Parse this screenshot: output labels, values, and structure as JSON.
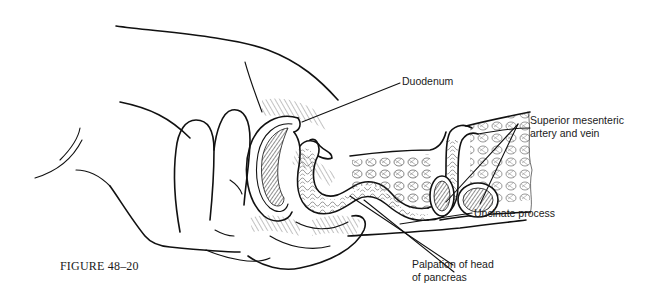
{
  "figure": {
    "caption": "FIGURE 48–20",
    "labels": {
      "duodenum": "Duodenum",
      "sma_line1": "Superior mesenteric",
      "sma_line2": "artery and vein",
      "uncinate": "Uncinate process",
      "palpation_line1": "Palpation of head",
      "palpation_line2": "of pancreas"
    },
    "colors": {
      "ink": "#111111",
      "background": "#ffffff",
      "text": "#1a1a1a"
    }
  }
}
